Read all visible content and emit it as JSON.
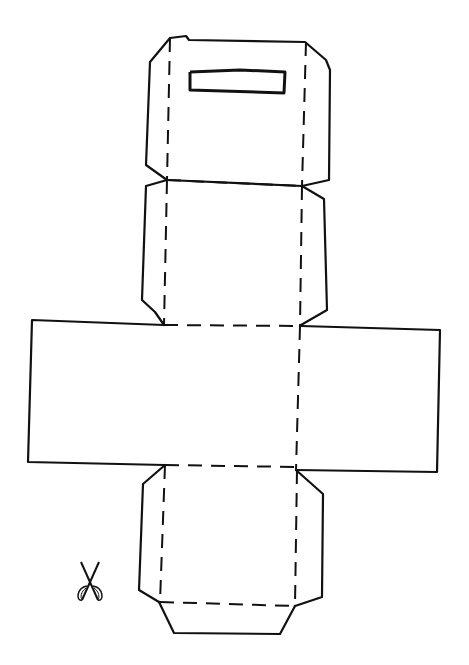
{
  "diagram": {
    "stroke_color": "#111111",
    "background": "#ffffff",
    "cut_paths": [
      {
        "name": "top-panel-outline",
        "points": "170,38 186,36 189,40 305,42 326,60 330,70 329,180 302,186 167,180 146,165 150,62 160,50 170,38"
      },
      {
        "name": "second-panel-left-flap",
        "points": "167,180 146,186 142,300 155,312 164,325"
      },
      {
        "name": "second-panel-right-flap",
        "points": "302,186 324,199 327,310 301,325"
      },
      {
        "name": "middle-panel-outline",
        "points": "164,325 32,320 28,462 165,465"
      },
      {
        "name": "middle-panel-right",
        "points": "301,326 440,330 437,472 296,470"
      },
      {
        "name": "bottom-left-flap",
        "points": "165,465 143,484 139,590 159,602"
      },
      {
        "name": "bottom-right-flap",
        "points": "296,470 323,494 322,597 295,606"
      },
      {
        "name": "bottom-tab",
        "points": "159,602 174,633 280,634 295,606"
      }
    ],
    "fold_lines": [
      {
        "name": "top-left-fold",
        "x1": 170,
        "y1": 38,
        "x2": 167,
        "y2": 180
      },
      {
        "name": "top-right-fold",
        "x1": 306,
        "y1": 42,
        "x2": 302,
        "y2": 186
      },
      {
        "name": "top-bottom-fold",
        "x1": 167,
        "y1": 180,
        "x2": 302,
        "y2": 186
      },
      {
        "name": "second-left-fold",
        "x1": 167,
        "y1": 180,
        "x2": 164,
        "y2": 325
      },
      {
        "name": "second-right-fold",
        "x1": 302,
        "y1": 186,
        "x2": 300,
        "y2": 326
      },
      {
        "name": "second-bottom-fold",
        "x1": 164,
        "y1": 325,
        "x2": 300,
        "y2": 326
      },
      {
        "name": "middle-right-fold",
        "x1": 300,
        "y1": 326,
        "x2": 296,
        "y2": 470
      },
      {
        "name": "middle-bottom-fold",
        "x1": 165,
        "y1": 465,
        "x2": 296,
        "y2": 467
      },
      {
        "name": "bottom-left-fold",
        "x1": 165,
        "y1": 465,
        "x2": 160,
        "y2": 602
      },
      {
        "name": "bottom-right-fold",
        "x1": 297,
        "y1": 470,
        "x2": 295,
        "y2": 606
      },
      {
        "name": "bottom-tab-fold",
        "x1": 160,
        "y1": 602,
        "x2": 295,
        "y2": 606
      }
    ],
    "slot": {
      "name": "handle-slot",
      "points": "190,72 240,70 285,72 284,93 190,90 190,72"
    },
    "scissors_icon": {
      "name": "scissors-icon",
      "x": 90,
      "y": 582
    }
  }
}
